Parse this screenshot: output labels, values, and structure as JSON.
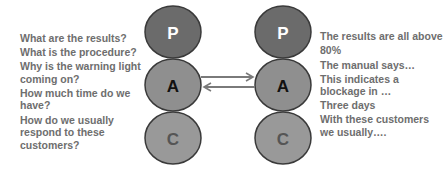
{
  "diagram": {
    "type": "transactional-analysis",
    "colors": {
      "parent": "#6b6b6b",
      "adult": "#8f8f8f",
      "child": "#999999",
      "stroke": "#3a3a3a",
      "arrow": "#7a7a7a",
      "text": "#6e6e6e"
    },
    "left_person": {
      "states": [
        {
          "id": "P",
          "label": "P"
        },
        {
          "id": "A",
          "label": "A"
        },
        {
          "id": "C",
          "label": "C"
        }
      ],
      "questions": [
        "What are the results?",
        "What is the procedure?",
        "Why is the warning light coming on?",
        "How much time do we have?",
        "How do we usually respond to these customers?"
      ]
    },
    "right_person": {
      "states": [
        {
          "id": "P",
          "label": "P"
        },
        {
          "id": "A",
          "label": "A"
        },
        {
          "id": "C",
          "label": "C"
        }
      ],
      "answers": [
        "The results are all above 80%",
        "The manual says…",
        "This indicates a blockage in …",
        "Three days",
        "With these customers we usually…."
      ]
    },
    "arrows": [
      {
        "from": "left.A",
        "to": "right.A",
        "direction": "right"
      },
      {
        "from": "right.A",
        "to": "left.A",
        "direction": "left"
      }
    ]
  }
}
